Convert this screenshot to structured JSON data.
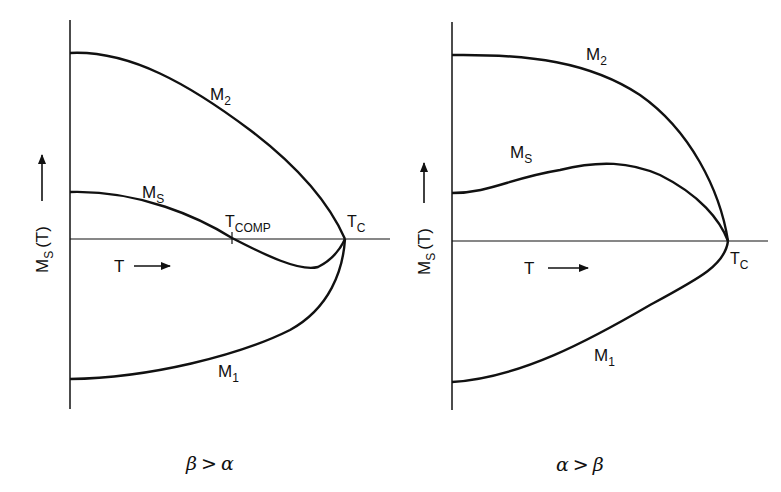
{
  "panels": [
    {
      "id": "left",
      "condition": {
        "a": "β",
        "op": ">",
        "b": "α"
      },
      "y_axis_label": {
        "main": "M",
        "sub": "S",
        "rest": "(T)"
      },
      "x_axis_label": "T",
      "curves": [
        {
          "name": "M",
          "sub": "2"
        },
        {
          "name": "M",
          "sub": "S"
        },
        {
          "name": "M",
          "sub": "1"
        }
      ],
      "points": [
        {
          "name": "T",
          "sub": "COMP"
        },
        {
          "name": "T",
          "sub": "C"
        }
      ]
    },
    {
      "id": "right",
      "condition": {
        "a": "α",
        "op": ">",
        "b": "β"
      },
      "y_axis_label": {
        "main": "M",
        "sub": "S",
        "rest": "(T)"
      },
      "x_axis_label": "T",
      "curves": [
        {
          "name": "M",
          "sub": "2"
        },
        {
          "name": "M",
          "sub": "S"
        },
        {
          "name": "M",
          "sub": "1"
        }
      ],
      "points": [
        {
          "name": "T",
          "sub": "C"
        }
      ]
    }
  ],
  "colors": {
    "ink": "#111111",
    "background": "#ffffff"
  }
}
